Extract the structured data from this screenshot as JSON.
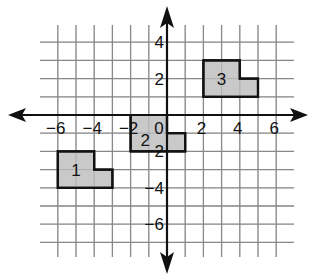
{
  "diagram": {
    "type": "coordinate-grid",
    "origin_px": [
      167,
      115
    ],
    "unit_px": 18.2,
    "x_range": [
      -7,
      7
    ],
    "y_range": [
      -7,
      4
    ],
    "x_tick_labels": [
      "−6",
      "−4",
      "−2",
      "0",
      "2",
      "4",
      "6"
    ],
    "y_tick_labels": [
      "4",
      "2",
      "−2",
      "−4",
      "−6"
    ],
    "colors": {
      "grid": "#8a8a8a",
      "axis": "#111111",
      "shape_fill": "#c4c4c4",
      "shape_stroke": "#111111"
    },
    "shapes": [
      {
        "label": "1",
        "vertices": [
          [
            -6,
            -2
          ],
          [
            -4,
            -2
          ],
          [
            -4,
            -3
          ],
          [
            -3,
            -3
          ],
          [
            -3,
            -4
          ],
          [
            -6,
            -4
          ]
        ]
      },
      {
        "label": "2",
        "vertices": [
          [
            -2,
            0
          ],
          [
            0,
            0
          ],
          [
            0,
            -1
          ],
          [
            1,
            -1
          ],
          [
            1,
            -2
          ],
          [
            -2,
            -2
          ]
        ]
      },
      {
        "label": "3",
        "vertices": [
          [
            2,
            3
          ],
          [
            4,
            3
          ],
          [
            4,
            2
          ],
          [
            5,
            2
          ],
          [
            5,
            1
          ],
          [
            2,
            1
          ]
        ]
      }
    ]
  }
}
